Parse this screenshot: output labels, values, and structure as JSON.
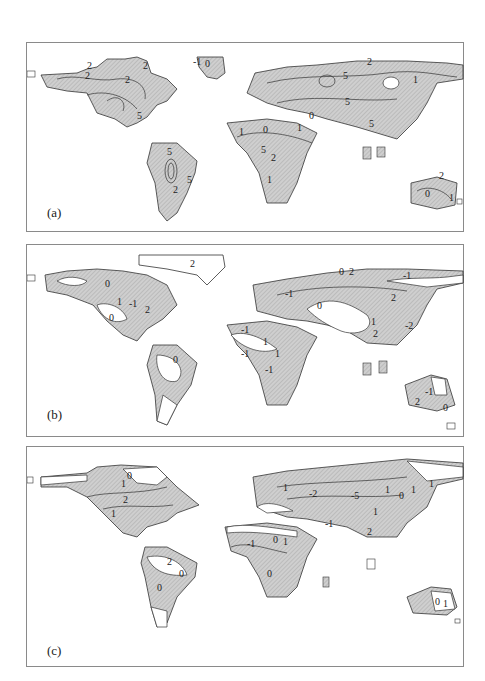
{
  "figure": {
    "panels": [
      {
        "id": "a",
        "label": "(a)",
        "contour_labels": [
          "2",
          "2",
          "2",
          "2",
          "5",
          "-1",
          "0",
          "2",
          "5",
          "5",
          "1",
          "0",
          "0",
          "5",
          "1",
          "1",
          "5",
          "2",
          "1",
          "5",
          "5",
          "2",
          "2",
          "0",
          "1"
        ]
      },
      {
        "id": "b",
        "label": "(b)",
        "contour_labels": [
          "0",
          "1",
          "-1",
          "2",
          "0",
          "2",
          "0",
          "2",
          "-1",
          "-1",
          "2",
          "0",
          "1",
          "2",
          "-2",
          "-1",
          "1",
          "1",
          "-1",
          "0",
          "-1",
          "-1",
          "2",
          "0"
        ]
      },
      {
        "id": "c",
        "label": "(c)",
        "contour_labels": [
          "0",
          "1",
          "2",
          "1",
          "1",
          "-2",
          "-5",
          "1",
          "0",
          "1",
          "1",
          "1",
          "-1",
          "2",
          "-1",
          "0",
          "1",
          "0",
          "2",
          "0",
          "0",
          "0",
          "1"
        ]
      }
    ],
    "style": {
      "land_fill": "#cfcfcf",
      "hatch_color": "#9a9a9a",
      "contour_color": "#333333",
      "border_color": "#8a8a8a",
      "background": "#ffffff"
    }
  }
}
